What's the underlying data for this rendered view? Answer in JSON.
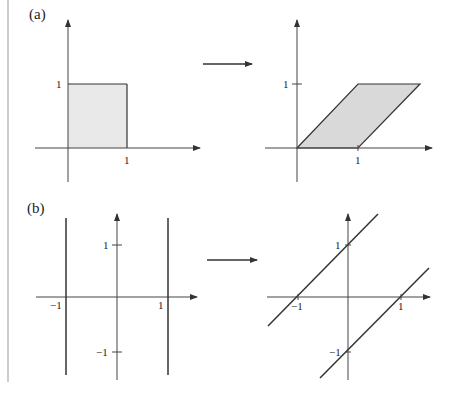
{
  "panels": {
    "a": {
      "label": "(a)",
      "before": {
        "tick_y": "1",
        "tick_x": "1",
        "shape": "unit square [0,1]x[0,1]"
      },
      "after": {
        "tick_y": "1",
        "tick_x": "1",
        "shape": "parallelogram (0,0),(1,0),(2,1),(1,1)"
      }
    },
    "b": {
      "label": "(b)",
      "before": {
        "tick_y_pos": "1",
        "tick_y_neg": "−1",
        "tick_x_neg": "−1",
        "tick_x_pos": "1",
        "shape": "vertical lines x=-1 and x=1"
      },
      "after": {
        "tick_y_pos": "1",
        "tick_y_neg": "−1",
        "tick_x_neg": "−1",
        "tick_x_pos": "1",
        "shape": "lines y=x+1 and y=x-1"
      }
    }
  },
  "colors": {
    "line": "#333333",
    "axis": "#444444",
    "fill": "#e6e6e6",
    "fill_dark": "#d6d6d6",
    "border": "#999999"
  }
}
